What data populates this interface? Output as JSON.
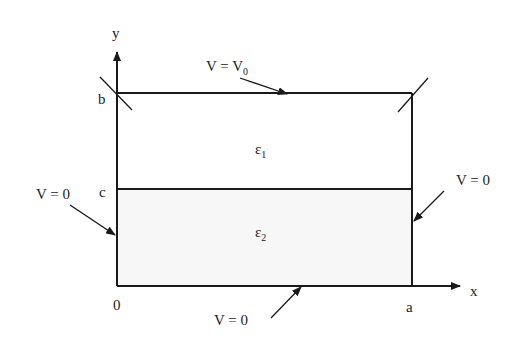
{
  "diagram": {
    "axes": {
      "x_label": "x",
      "y_label": "y"
    },
    "points": {
      "origin": "0",
      "a": "a",
      "b": "b",
      "c": "c"
    },
    "regions": [
      {
        "name": "upper",
        "symbol": "ε",
        "subscript": "1",
        "fill": "#ffffff"
      },
      {
        "name": "lower",
        "symbol": "ε",
        "subscript": "2",
        "fill": "#f7f7f7"
      }
    ],
    "boundaries": {
      "top": {
        "label": "V = V",
        "subscript": "0"
      },
      "left": {
        "label": "V = 0"
      },
      "right": {
        "label": "V = 0"
      },
      "bottom": {
        "label": "V = 0"
      }
    },
    "colors": {
      "line": "#1a1a1a",
      "text": "#222222"
    }
  }
}
